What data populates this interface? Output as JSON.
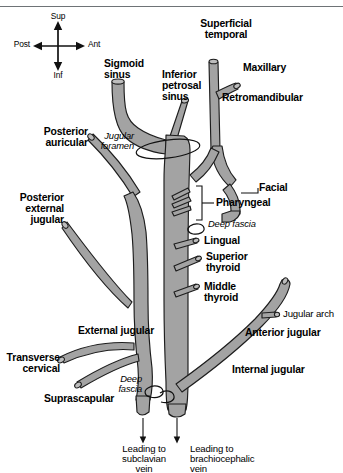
{
  "figure": {
    "background_color": "#ffffff",
    "vessel_fill_color": "#a3a3a3",
    "vessel_outline_color": "#1d1d1d",
    "text_color": "#000000"
  },
  "compass": {
    "superior": "Sup",
    "inferior": "Inf",
    "anterior": "Ant",
    "posterior": "Post"
  },
  "labels": {
    "sigmoid_sinus": "Sigmoid\nsinus",
    "inferior_petrosal_sinus": "Inferior\npetrosal\nsinus",
    "jugular_foramen": "Jugular\nforamen",
    "superficial_temporal": "Superficial\ntemporal",
    "maxillary": "Maxillary",
    "retromandibular": "Retromandibular",
    "posterior_auricular": "Posterior\nauricular",
    "posterior_external_jugular": "Posterior\nexternal\njugular",
    "facial": "Facial",
    "pharyngeal": "Pharyngeal",
    "deep_fascia_upper": "Deep fascia",
    "lingual": "Lingual",
    "superior_thyroid": "Superior\nthyroid",
    "middle_thyroid": "Middle\nthyroid",
    "jugular_arch": "Jugular arch",
    "anterior_jugular": "Anterior jugular",
    "internal_jugular": "Internal jugular",
    "external_jugular": "External jugular",
    "transverse_cervical": "Transverse\ncervical",
    "suprascapular": "Suprascapular",
    "deep_fascia_lower": "Deep\nfascia",
    "leading_to_subclavian": "Leading to\nsubclavian\nvein",
    "leading_to_brachiocephalic": "Leading to\nbrachiocephalic\nvein"
  }
}
